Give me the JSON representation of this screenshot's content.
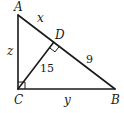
{
  "diagram": {
    "type": "right-triangle-with-altitude",
    "vertices": {
      "A": {
        "label": "A",
        "x": 18,
        "y": 15
      },
      "B": {
        "label": "B",
        "x": 115,
        "y": 89
      },
      "C": {
        "label": "C",
        "x": 18,
        "y": 89
      },
      "D": {
        "label": "D",
        "x": 53.7,
        "y": 42.2
      }
    },
    "segments": {
      "AD": {
        "label": "x"
      },
      "DB": {
        "label": "9"
      },
      "CD": {
        "label": "15"
      },
      "AC": {
        "label": "z"
      },
      "CB": {
        "label": "y"
      }
    },
    "right_angles": [
      "C",
      "D"
    ],
    "colors": {
      "stroke": "#1a1a1a",
      "background": "#ffffff"
    }
  }
}
